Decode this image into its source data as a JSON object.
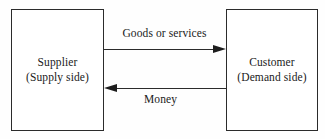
{
  "diagram": {
    "background_color": "#fefefe",
    "line_color": "#2b2b2b",
    "text_color": "#1a1a1a",
    "nodes": [
      {
        "id": "supplier",
        "name": "Supplier",
        "subtitle": "(Supply side)"
      },
      {
        "id": "customer",
        "name": "Customer",
        "subtitle": "(Demand side)"
      }
    ],
    "flows": [
      {
        "id": "goods",
        "label": "Goods or services",
        "from": "Supplier",
        "to": "Customer",
        "direction": "right"
      },
      {
        "id": "money",
        "label": "Money",
        "from": "Customer",
        "to": "Supplier",
        "direction": "left"
      }
    ]
  }
}
